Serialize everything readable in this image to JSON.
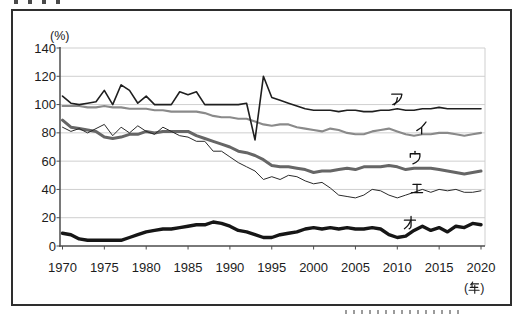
{
  "figure": {
    "background": "#ffffff",
    "border_color": "#2e2e2e",
    "y_axis_unit": "(%)",
    "x_axis_unit": "(年)"
  },
  "chart_data": {
    "type": "line",
    "title": "",
    "xlabel": "(年)",
    "ylabel": "(%)",
    "x_range": [
      1970,
      2020
    ],
    "y_range": [
      0,
      140
    ],
    "x_ticks": [
      1970,
      1975,
      1980,
      1985,
      1990,
      1995,
      2000,
      2005,
      2010,
      2015,
      2020
    ],
    "y_ticks": [
      0,
      20,
      40,
      60,
      80,
      100,
      120,
      140
    ],
    "grid": "horizontal-light-gray",
    "legend_position": "inline-labels-right-of-lines",
    "years": [
      1970,
      1971,
      1972,
      1973,
      1974,
      1975,
      1976,
      1977,
      1978,
      1979,
      1980,
      1981,
      1982,
      1983,
      1984,
      1985,
      1986,
      1987,
      1988,
      1989,
      1990,
      1991,
      1992,
      1993,
      1994,
      1995,
      1996,
      1997,
      1998,
      1999,
      2000,
      2001,
      2002,
      2003,
      2004,
      2005,
      2006,
      2007,
      2008,
      2009,
      2010,
      2011,
      2012,
      2013,
      2014,
      2015,
      2016,
      2017,
      2018,
      2019,
      2020
    ],
    "series": [
      {
        "name": "ア",
        "color": "#1f1f1f",
        "width": 1.6,
        "label_x": 390,
        "label_y": 90,
        "values": [
          106,
          101,
          100,
          101,
          102,
          110,
          100,
          114,
          110,
          101,
          106,
          100,
          100,
          100,
          109,
          107,
          109,
          100,
          100,
          100,
          100,
          100,
          101,
          75,
          120,
          105,
          103,
          101,
          99,
          97,
          96,
          96,
          96,
          95,
          96,
          96,
          95,
          95,
          96,
          96,
          97,
          96,
          96,
          97,
          97,
          98,
          97,
          97,
          97,
          97,
          97
        ]
      },
      {
        "name": "イ",
        "color": "#8a8a8a",
        "width": 2.1,
        "label_x": 415,
        "label_y": 119,
        "values": [
          99,
          99,
          99,
          98,
          98,
          99,
          98,
          98,
          97,
          97,
          97,
          96,
          96,
          95,
          95,
          95,
          95,
          94,
          92,
          91,
          91,
          90,
          90,
          88,
          86,
          85,
          86,
          86,
          84,
          83,
          82,
          81,
          83,
          82,
          80,
          79,
          79,
          81,
          82,
          83,
          81,
          79,
          78,
          79,
          79,
          80,
          80,
          79,
          78,
          79,
          80
        ]
      },
      {
        "name": "ウ",
        "color": "#666666",
        "width": 3.0,
        "label_x": 408,
        "label_y": 149,
        "values": [
          89,
          84,
          83,
          82,
          81,
          77,
          76,
          77,
          79,
          79,
          81,
          80,
          81,
          81,
          81,
          81,
          78,
          76,
          74,
          72,
          70,
          67,
          66,
          64,
          61,
          57,
          56,
          56,
          55,
          54,
          52,
          53,
          53,
          54,
          55,
          54,
          56,
          56,
          56,
          57,
          56,
          54,
          55,
          55,
          55,
          54,
          53,
          52,
          51,
          52,
          53
        ]
      },
      {
        "name": "エ",
        "color": "#2a2a2a",
        "width": 1.0,
        "label_x": 410,
        "label_y": 180,
        "values": [
          84,
          81,
          83,
          80,
          83,
          86,
          78,
          84,
          80,
          85,
          81,
          79,
          84,
          81,
          78,
          77,
          74,
          74,
          67,
          67,
          63,
          59,
          56,
          53,
          47,
          49,
          47,
          50,
          49,
          46,
          44,
          45,
          41,
          36,
          35,
          34,
          36,
          40,
          39,
          36,
          34,
          36,
          38,
          40,
          38,
          40,
          39,
          40,
          38,
          38,
          39
        ]
      },
      {
        "name": "オ",
        "color": "#161616",
        "width": 3.4,
        "label_x": 403,
        "label_y": 214,
        "values": [
          9,
          8,
          5,
          4,
          4,
          4,
          4,
          4,
          6,
          8,
          10,
          11,
          12,
          12,
          13,
          14,
          15,
          15,
          17,
          16,
          14,
          11,
          10,
          8,
          6,
          6,
          8,
          9,
          10,
          12,
          13,
          12,
          13,
          12,
          13,
          12,
          12,
          13,
          12,
          8,
          6,
          7,
          11,
          14,
          11,
          13,
          10,
          14,
          13,
          16,
          15
        ]
      }
    ]
  }
}
